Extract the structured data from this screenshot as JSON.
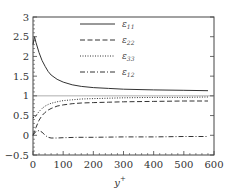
{
  "chart_data": {
    "type": "line",
    "title": "",
    "xlabel": "y⁺",
    "ylabel": "",
    "xlim": [
      0,
      600
    ],
    "ylim": [
      -0.5,
      3
    ],
    "xticks": [
      0,
      100,
      200,
      300,
      400,
      500,
      600
    ],
    "yticks": [
      -0.5,
      0,
      0.5,
      1,
      1.5,
      2,
      2.5,
      3
    ],
    "xtick_labels": [
      "0",
      "100",
      "200",
      "300",
      "400",
      "500",
      "600"
    ],
    "ytick_labels": [
      "−0.5",
      "0",
      "0.5",
      "1",
      "1.5",
      "2",
      "2.5",
      "3"
    ],
    "grid": false,
    "legend_position": "upper right",
    "reference_lines": [
      {
        "y": 1,
        "style": "solid",
        "color": "#999999"
      }
    ],
    "series": [
      {
        "name": "ε11",
        "style": "solid",
        "x": [
          0,
          5,
          10,
          20,
          30,
          40,
          50,
          60,
          80,
          100,
          130,
          160,
          200,
          250,
          300,
          400,
          500,
          580
        ],
        "y": [
          2.3,
          2.5,
          2.35,
          2.1,
          1.9,
          1.75,
          1.62,
          1.53,
          1.42,
          1.35,
          1.28,
          1.24,
          1.21,
          1.19,
          1.17,
          1.15,
          1.14,
          1.13
        ]
      },
      {
        "name": "ε22",
        "style": "dashed",
        "x": [
          0,
          5,
          10,
          20,
          30,
          40,
          50,
          60,
          80,
          100,
          130,
          160,
          200,
          250,
          300,
          400,
          500,
          580
        ],
        "y": [
          0.0,
          0.1,
          0.2,
          0.38,
          0.5,
          0.58,
          0.64,
          0.68,
          0.74,
          0.77,
          0.8,
          0.82,
          0.83,
          0.84,
          0.85,
          0.86,
          0.87,
          0.87
        ]
      },
      {
        "name": "ε33",
        "style": "dotted",
        "x": [
          0,
          5,
          10,
          20,
          30,
          40,
          50,
          60,
          80,
          100,
          130,
          160,
          200,
          250,
          300,
          400,
          500,
          580
        ],
        "y": [
          0.45,
          0.45,
          0.5,
          0.6,
          0.68,
          0.74,
          0.78,
          0.81,
          0.85,
          0.88,
          0.9,
          0.92,
          0.93,
          0.94,
          0.95,
          0.96,
          0.96,
          0.97
        ]
      },
      {
        "name": "ε12",
        "style": "dashdot",
        "x": [
          0,
          5,
          10,
          20,
          30,
          40,
          50,
          60,
          80,
          100,
          150,
          200,
          300,
          400,
          500,
          580
        ],
        "y": [
          0.0,
          0.05,
          0.1,
          0.12,
          0.08,
          0.0,
          -0.05,
          -0.07,
          -0.07,
          -0.06,
          -0.05,
          -0.05,
          -0.04,
          -0.04,
          -0.03,
          -0.03
        ]
      }
    ]
  },
  "legend": {
    "items": [
      {
        "label": "ε",
        "sub": "11"
      },
      {
        "label": "ε",
        "sub": "22"
      },
      {
        "label": "ε",
        "sub": "33"
      },
      {
        "label": "ε",
        "sub": "12"
      }
    ]
  },
  "axes": {
    "xlabel_main": "y",
    "xlabel_sup": "+"
  }
}
